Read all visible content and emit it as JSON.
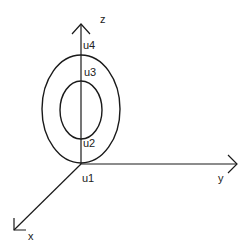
{
  "diagram": {
    "axes": {
      "x": {
        "label": "x"
      },
      "y": {
        "label": "y"
      },
      "z": {
        "label": "z"
      }
    },
    "points": [
      {
        "id": "u1",
        "label": "u1"
      },
      {
        "id": "u2",
        "label": "u2"
      },
      {
        "id": "u3",
        "label": "u3"
      },
      {
        "id": "u4",
        "label": "u4"
      }
    ],
    "shapes": [
      {
        "name": "outer-ellipse",
        "description": "outer ring in z-y plane, passes through u1 and u4"
      },
      {
        "name": "inner-ellipse",
        "description": "inner ring in z-y plane, passes through u2 and u3"
      }
    ],
    "colors": {
      "stroke": "#1a1a1a",
      "background": "#ffffff"
    }
  }
}
